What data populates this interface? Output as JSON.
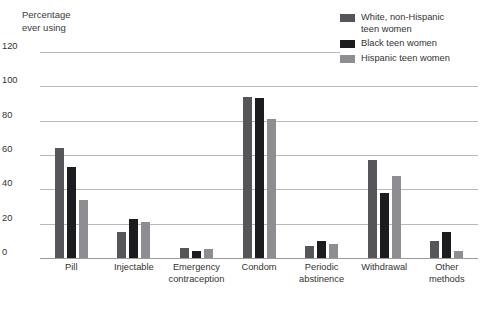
{
  "chart_data": {
    "type": "bar",
    "title": "",
    "ylabel": "Percentage\never using",
    "xlabel": "",
    "ylim": [
      0,
      120
    ],
    "yticks": [
      0,
      20,
      40,
      60,
      80,
      100,
      120
    ],
    "ytick_labels": [
      "0",
      "20",
      "40",
      "60",
      "80",
      "100",
      "120"
    ],
    "grid": true,
    "legend_position": "top-right",
    "categories": [
      "Pill",
      "Injectable",
      "Emergency\ncontraception",
      "Condom",
      "Periodic\nabstinence",
      "Withdrawal",
      "Other\nmethods"
    ],
    "series": [
      {
        "name": "White, non-Hispanic\nteen women",
        "color": "#56565a",
        "values": [
          64,
          15,
          6,
          94,
          7,
          57,
          10
        ]
      },
      {
        "name": "Black teen women",
        "color": "#1c1c20",
        "values": [
          53,
          23,
          4,
          93,
          10,
          38,
          15
        ]
      },
      {
        "name": "Hispanic teen women",
        "color": "#8e8e92",
        "values": [
          34,
          21,
          5,
          81,
          8,
          48,
          4
        ]
      }
    ]
  },
  "colors": {
    "gridline": "#b9b9b9",
    "baseline": "#9a9a9a",
    "text": "#333333",
    "background": "#ffffff"
  }
}
